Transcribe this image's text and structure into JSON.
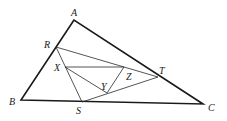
{
  "figure": {
    "points": {
      "A": {
        "x": 74,
        "y": 20,
        "label": "A",
        "lx": 71,
        "ly": 16
      },
      "B": {
        "x": 21,
        "y": 100,
        "label": "B",
        "lx": 9,
        "ly": 105
      },
      "C": {
        "x": 203,
        "y": 104,
        "label": "C",
        "lx": 208,
        "ly": 111
      },
      "R": {
        "x": 56,
        "y": 47,
        "label": "R",
        "lx": 44,
        "ly": 48
      },
      "S": {
        "x": 82,
        "y": 102,
        "label": "S",
        "lx": 76,
        "ly": 114
      },
      "T": {
        "x": 158,
        "y": 77,
        "label": "T",
        "lx": 159,
        "ly": 74
      },
      "X": {
        "x": 65,
        "y": 67,
        "label": "X",
        "lx": 54,
        "ly": 71
      },
      "Y": {
        "x": 107,
        "y": 93,
        "label": "Y",
        "lx": 101,
        "ly": 90
      },
      "Z": {
        "x": 124,
        "y": 67,
        "label": "Z",
        "lx": 126,
        "ly": 80
      }
    },
    "triangles": [
      {
        "name": "ABC",
        "vertices": [
          "A",
          "B",
          "C"
        ],
        "style": "outer"
      },
      {
        "name": "RST",
        "vertices": [
          "R",
          "S",
          "T"
        ],
        "style": "inner"
      },
      {
        "name": "XYZ",
        "vertices": [
          "X",
          "Y",
          "Z"
        ],
        "style": "inner"
      }
    ],
    "colors": {
      "stroke": "#1a1a1a",
      "background": "#ffffff"
    }
  }
}
